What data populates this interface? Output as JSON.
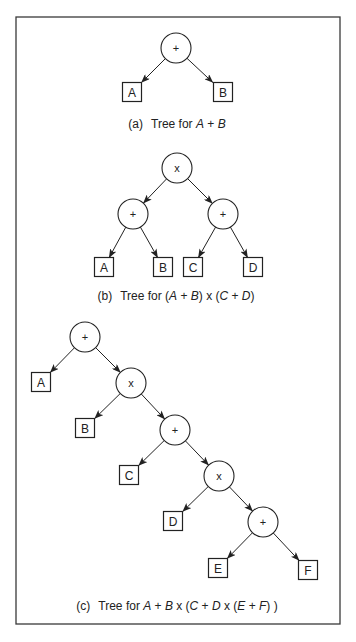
{
  "figure": {
    "frame": {
      "x": 16,
      "y": 17,
      "width": 324,
      "height": 607
    },
    "circle_radius": 15,
    "box_size": 19
  },
  "trees": [
    {
      "id": "a",
      "caption": {
        "label": "(a)",
        "text": "Tree for ",
        "expr": [
          "A",
          " + ",
          "B"
        ],
        "italic": [
          true,
          false,
          true
        ],
        "x": 177,
        "y": 128
      },
      "nodes": [
        {
          "id": "a_root",
          "type": "op",
          "label": "+",
          "x": 176,
          "y": 48
        },
        {
          "id": "a_A",
          "type": "leaf",
          "label": "A",
          "x": 132,
          "y": 92
        },
        {
          "id": "a_B",
          "type": "leaf",
          "label": "B",
          "x": 223,
          "y": 92
        }
      ],
      "edges": [
        [
          "a_root",
          "a_A"
        ],
        [
          "a_root",
          "a_B"
        ]
      ]
    },
    {
      "id": "b",
      "caption": {
        "label": "(b)",
        "text": "Tree for ",
        "expr": [
          "(",
          "A",
          " + ",
          "B",
          ") x (",
          "C",
          " + ",
          "D",
          ")"
        ],
        "italic": [
          false,
          true,
          false,
          true,
          false,
          true,
          false,
          true,
          false
        ],
        "x": 176,
        "y": 300
      },
      "nodes": [
        {
          "id": "b_root",
          "type": "op",
          "label": "x",
          "x": 177,
          "y": 168
        },
        {
          "id": "b_l",
          "type": "op",
          "label": "+",
          "x": 133,
          "y": 214
        },
        {
          "id": "b_r",
          "type": "op",
          "label": "+",
          "x": 223,
          "y": 214
        },
        {
          "id": "b_A",
          "type": "leaf",
          "label": "A",
          "x": 104,
          "y": 267
        },
        {
          "id": "b_B",
          "type": "leaf",
          "label": "B",
          "x": 163,
          "y": 267
        },
        {
          "id": "b_C",
          "type": "leaf",
          "label": "C",
          "x": 193,
          "y": 267
        },
        {
          "id": "b_D",
          "type": "leaf",
          "label": "D",
          "x": 253,
          "y": 267
        }
      ],
      "edges": [
        [
          "b_root",
          "b_l"
        ],
        [
          "b_root",
          "b_r"
        ],
        [
          "b_l",
          "b_A"
        ],
        [
          "b_l",
          "b_B"
        ],
        [
          "b_r",
          "b_C"
        ],
        [
          "b_r",
          "b_D"
        ]
      ]
    },
    {
      "id": "c",
      "caption": {
        "label": "(c)",
        "text": "Tree for ",
        "expr": [
          "A",
          " + ",
          "B",
          " x (",
          "C",
          " + ",
          "D",
          " x (",
          "E",
          " + ",
          "F",
          ") )"
        ],
        "italic": [
          true,
          false,
          true,
          false,
          true,
          false,
          true,
          false,
          true,
          false,
          true,
          false
        ],
        "x": 177,
        "y": 610
      },
      "nodes": [
        {
          "id": "c_1",
          "type": "op",
          "label": "+",
          "x": 85,
          "y": 337
        },
        {
          "id": "c_A",
          "type": "leaf",
          "label": "A",
          "x": 41,
          "y": 382
        },
        {
          "id": "c_2",
          "type": "op",
          "label": "x",
          "x": 131,
          "y": 383
        },
        {
          "id": "c_B",
          "type": "leaf",
          "label": "B",
          "x": 85,
          "y": 428
        },
        {
          "id": "c_3",
          "type": "op",
          "label": "+",
          "x": 175,
          "y": 430
        },
        {
          "id": "c_C",
          "type": "leaf",
          "label": "C",
          "x": 129,
          "y": 475
        },
        {
          "id": "c_4",
          "type": "op",
          "label": "x",
          "x": 219,
          "y": 476
        },
        {
          "id": "c_D",
          "type": "leaf",
          "label": "D",
          "x": 173,
          "y": 521
        },
        {
          "id": "c_5",
          "type": "op",
          "label": "+",
          "x": 263,
          "y": 522
        },
        {
          "id": "c_E",
          "type": "leaf",
          "label": "E",
          "x": 218,
          "y": 568
        },
        {
          "id": "c_F",
          "type": "leaf",
          "label": "F",
          "x": 308,
          "y": 570
        }
      ],
      "edges": [
        [
          "c_1",
          "c_A"
        ],
        [
          "c_1",
          "c_2"
        ],
        [
          "c_2",
          "c_B"
        ],
        [
          "c_2",
          "c_3"
        ],
        [
          "c_3",
          "c_C"
        ],
        [
          "c_3",
          "c_4"
        ],
        [
          "c_4",
          "c_D"
        ],
        [
          "c_4",
          "c_5"
        ],
        [
          "c_5",
          "c_E"
        ],
        [
          "c_5",
          "c_F"
        ]
      ]
    }
  ]
}
